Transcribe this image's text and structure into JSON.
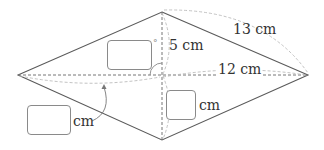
{
  "diagram": {
    "type": "rhombus",
    "vertices": {
      "top": [
        162,
        12
      ],
      "right": [
        308,
        75
      ],
      "bottom": [
        162,
        140
      ],
      "left": [
        18,
        75
      ],
      "center": [
        162,
        75
      ]
    },
    "labels": {
      "half_vertical_diagonal": "5 cm",
      "half_horizontal_diagonal": "12 cm",
      "side": "13 cm",
      "lower_half_vertical_unit": "cm",
      "left_half_horizontal_unit": "cm"
    },
    "answer_boxes": [
      {
        "id": "angle-box",
        "purpose": "angle measure at center",
        "unit_mark": "°",
        "value": ""
      },
      {
        "id": "lower-half-diagonal-box",
        "purpose": "length of lower half of vertical diagonal",
        "unit": "cm",
        "value": ""
      },
      {
        "id": "left-half-diagonal-box",
        "purpose": "length of left half of horizontal diagonal",
        "unit": "cm",
        "value": ""
      }
    ],
    "colors": {
      "edge": "#555555",
      "diagonal": "#777777",
      "arc": "#bbbbbb",
      "box_border": "#8a8a8a",
      "text": "#333333"
    }
  }
}
